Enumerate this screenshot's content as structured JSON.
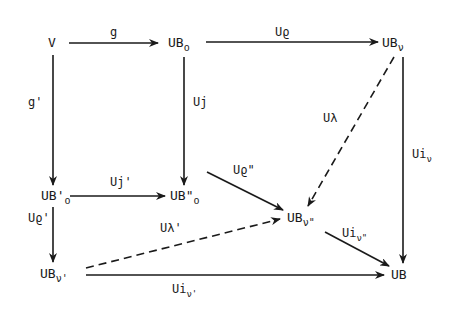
{
  "diagram": {
    "type": "commutative-diagram",
    "nodes": {
      "V": {
        "main": "V",
        "sub": ""
      },
      "UBo": {
        "main": "UB",
        "sub": "o"
      },
      "UBnu": {
        "main": "UB",
        "sub": "ν"
      },
      "UBpo": {
        "main": "UB'",
        "sub": "o"
      },
      "UBppo": {
        "main": "UB\"",
        "sub": "o"
      },
      "UBnupp": {
        "main": "UB",
        "sub": "ν\""
      },
      "UBnup": {
        "main": "UB",
        "sub": "ν'"
      },
      "UB": {
        "main": "UB",
        "sub": ""
      }
    },
    "edges": {
      "g": {
        "main": "g",
        "sub": "",
        "from": "V",
        "to": "UBo",
        "style": "solid"
      },
      "Urho": {
        "main": "Uϱ",
        "sub": "",
        "from": "UBo",
        "to": "UBnu",
        "style": "solid"
      },
      "gp": {
        "main": "g'",
        "sub": "",
        "from": "V",
        "to": "UBpo",
        "style": "solid"
      },
      "Uj": {
        "main": "Uj",
        "sub": "",
        "from": "UBo",
        "to": "UBppo",
        "style": "solid"
      },
      "Ujp": {
        "main": "Uj'",
        "sub": "",
        "from": "UBpo",
        "to": "UBppo",
        "style": "solid"
      },
      "Ulambda": {
        "main": "Uλ",
        "sub": "",
        "from": "UBnu",
        "to": "UBnupp",
        "style": "dashed"
      },
      "Uinu": {
        "main": "Ui",
        "sub": "ν",
        "from": "UBnu",
        "to": "UB",
        "style": "solid"
      },
      "Urhopp": {
        "main": "Uϱ\"",
        "sub": "",
        "from": "UBppo",
        "to": "UBnupp",
        "style": "solid"
      },
      "Urhop": {
        "main": "Uϱ'",
        "sub": "",
        "from": "UBpo",
        "to": "UBnup",
        "style": "solid"
      },
      "Ulambdap": {
        "main": "Uλ'",
        "sub": "",
        "from": "UBnup",
        "to": "UBnupp",
        "style": "dashed"
      },
      "Uinupp": {
        "main": "Ui",
        "sub": "ν\"",
        "from": "UBnupp",
        "to": "UB",
        "style": "solid"
      },
      "Uinup": {
        "main": "Ui",
        "sub": "ν'",
        "from": "UBnup",
        "to": "UB",
        "style": "solid"
      }
    }
  }
}
